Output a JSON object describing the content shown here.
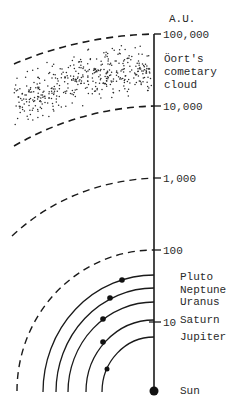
{
  "diagram": {
    "axis_unit": "A.U.",
    "scale_ticks": [
      {
        "label": "100,000",
        "y": 34
      },
      {
        "label": "10,000",
        "y": 106
      },
      {
        "label": "1,000",
        "y": 178
      },
      {
        "label": "100",
        "y": 250
      },
      {
        "label": "10",
        "y": 322
      }
    ],
    "cloud_label": [
      "Öort's",
      "cometary",
      "cloud"
    ],
    "planets": [
      {
        "name": "Pluto",
        "label_y": 277
      },
      {
        "name": "Neptune",
        "label_y": 290
      },
      {
        "name": "Uranus",
        "label_y": 302
      },
      {
        "name": "Saturn",
        "label_y": 320
      },
      {
        "name": "Jupiter",
        "label_y": 337
      }
    ],
    "sun_label": "Sun",
    "colors": {
      "ink": "#1a1a1a",
      "background": "#ffffff"
    }
  }
}
